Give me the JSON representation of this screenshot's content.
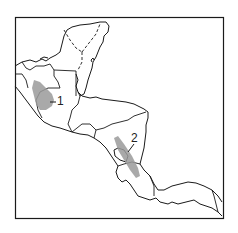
{
  "map": {
    "type": "outline map",
    "region": "Central America and southern Mexico",
    "colors": {
      "background": "#ffffff",
      "outline": "#1a1a1a",
      "shaded_area": "#9a9a9a"
    },
    "labels": [
      {
        "id": "1",
        "text": "1"
      },
      {
        "id": "2",
        "text": "2"
      }
    ]
  }
}
